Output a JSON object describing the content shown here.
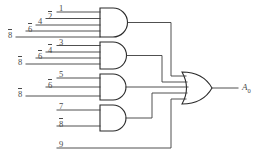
{
  "figure": {
    "output_label": "A",
    "output_subscript": "0"
  },
  "gates": [
    {
      "name": "and-gate-1",
      "type": "AND",
      "input_count": 5,
      "inputs": [
        "8",
        "6",
        "4",
        "2",
        "1"
      ],
      "overbars": [
        true,
        true,
        false,
        true,
        false
      ]
    },
    {
      "name": "and-gate-2",
      "type": "AND",
      "input_count": 4,
      "inputs": [
        "8",
        "6",
        "4",
        "3"
      ],
      "overbars": [
        true,
        true,
        true,
        false
      ]
    },
    {
      "name": "and-gate-3",
      "type": "AND",
      "input_count": 3,
      "inputs": [
        "8",
        "6",
        "5"
      ],
      "overbars": [
        true,
        true,
        false
      ]
    },
    {
      "name": "and-gate-4",
      "type": "AND",
      "input_count": 2,
      "inputs": [
        "8",
        "7"
      ],
      "overbars": [
        true,
        false
      ]
    },
    {
      "name": "or-gate",
      "type": "OR",
      "input_count": 5,
      "inputs": [],
      "overbars": []
    }
  ],
  "labels": {
    "g1_1": "1",
    "g1_2": "2",
    "g1_4": "4",
    "g1_6": "6",
    "g1_8": "8",
    "g2_3": "3",
    "g2_4": "4",
    "g2_6": "6",
    "g2_8": "8",
    "g3_5": "5",
    "g3_6": "6",
    "g3_8": "8",
    "g4_7": "7",
    "g4_8": "8",
    "direct_9": "9"
  },
  "colors": {
    "wire": "#3c3c3c",
    "gate_outline": "#2b2b2b",
    "text": "#4a4a4a",
    "background": "#ffffff"
  }
}
